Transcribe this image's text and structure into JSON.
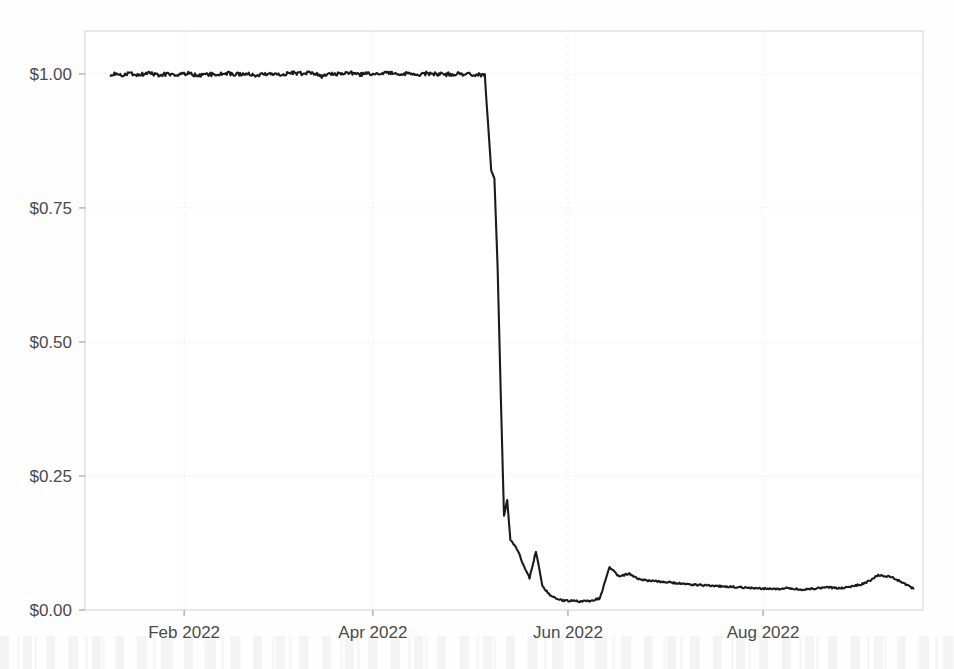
{
  "chart_data": {
    "type": "line",
    "title": "",
    "subtitle": "",
    "xlabel": "",
    "ylabel": "",
    "grid": true,
    "legend": "none",
    "value_prefix": "$",
    "xlim": [
      "2022-01-01",
      "2022-09-20"
    ],
    "ylim": [
      0.0,
      1.08
    ],
    "y_ticks": [
      0.0,
      0.25,
      0.5,
      0.75,
      1.0
    ],
    "y_tick_labels": [
      "$0.00",
      "$0.25",
      "$0.50",
      "$0.75",
      "$1.00"
    ],
    "x_ticks": [
      "2022-02-01",
      "2022-04-01",
      "2022-06-01",
      "2022-08-01"
    ],
    "x_tick_labels": [
      "Feb 2022",
      "Apr 2022",
      "Jun 2022",
      "Aug 2022"
    ],
    "series": [
      {
        "name": "Price",
        "color": "#1b1b1b",
        "x": [
          "2022-01-09",
          "2022-01-12",
          "2022-01-15",
          "2022-01-18",
          "2022-01-21",
          "2022-01-24",
          "2022-01-27",
          "2022-01-30",
          "2022-02-02",
          "2022-02-05",
          "2022-02-08",
          "2022-02-11",
          "2022-02-14",
          "2022-02-17",
          "2022-02-20",
          "2022-02-23",
          "2022-02-26",
          "2022-03-01",
          "2022-03-04",
          "2022-03-07",
          "2022-03-10",
          "2022-03-13",
          "2022-03-16",
          "2022-03-19",
          "2022-03-22",
          "2022-03-25",
          "2022-03-28",
          "2022-03-31",
          "2022-04-03",
          "2022-04-06",
          "2022-04-09",
          "2022-04-12",
          "2022-04-15",
          "2022-04-18",
          "2022-04-21",
          "2022-04-24",
          "2022-04-27",
          "2022-04-30",
          "2022-05-03",
          "2022-05-06",
          "2022-05-08",
          "2022-05-09",
          "2022-05-10",
          "2022-05-11",
          "2022-05-12",
          "2022-05-13",
          "2022-05-14",
          "2022-05-16",
          "2022-05-18",
          "2022-05-20",
          "2022-05-22",
          "2022-05-24",
          "2022-05-26",
          "2022-05-28",
          "2022-05-30",
          "2022-06-02",
          "2022-06-05",
          "2022-06-08",
          "2022-06-11",
          "2022-06-14",
          "2022-06-17",
          "2022-06-20",
          "2022-06-23",
          "2022-06-26",
          "2022-06-29",
          "2022-07-02",
          "2022-07-05",
          "2022-07-08",
          "2022-07-11",
          "2022-07-14",
          "2022-07-17",
          "2022-07-20",
          "2022-07-23",
          "2022-07-26",
          "2022-07-29",
          "2022-08-01",
          "2022-08-05",
          "2022-08-09",
          "2022-08-13",
          "2022-08-17",
          "2022-08-21",
          "2022-08-25",
          "2022-08-29",
          "2022-09-02",
          "2022-09-06",
          "2022-09-10",
          "2022-09-14",
          "2022-09-17"
        ],
        "y": [
          1.0,
          0.998,
          1.0,
          0.999,
          1.001,
          0.998,
          1.0,
          0.999,
          1.001,
          0.997,
          1.0,
          0.998,
          1.002,
          0.999,
          1.001,
          0.998,
          1.0,
          1.001,
          0.999,
          1.002,
          1.0,
          1.003,
          0.996,
          1.001,
          1.0,
          1.002,
          0.999,
          1.001,
          1.0,
          1.002,
          1.0,
          1.001,
          0.999,
          1.001,
          1.0,
          0.999,
          1.0,
          0.999,
          0.999,
          0.998,
          0.82,
          0.805,
          0.64,
          0.4,
          0.175,
          0.205,
          0.13,
          0.115,
          0.085,
          0.06,
          0.11,
          0.045,
          0.03,
          0.022,
          0.018,
          0.017,
          0.016,
          0.017,
          0.022,
          0.08,
          0.062,
          0.068,
          0.058,
          0.055,
          0.053,
          0.052,
          0.05,
          0.048,
          0.047,
          0.046,
          0.045,
          0.044,
          0.043,
          0.042,
          0.041,
          0.04,
          0.039,
          0.041,
          0.038,
          0.04,
          0.042,
          0.041,
          0.044,
          0.05,
          0.065,
          0.062,
          0.05,
          0.04
        ]
      }
    ],
    "annotations": []
  }
}
